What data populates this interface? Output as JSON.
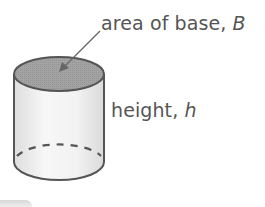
{
  "figure": {
    "type": "cylinder-diagram",
    "labels": {
      "base": {
        "text": "area of base, ",
        "variable": "B"
      },
      "height": {
        "text": "height, ",
        "variable": "h"
      }
    },
    "colors": {
      "outline": "#555555",
      "top_fill": "#9a9a9a",
      "body_fill_light": "#f4f4f4",
      "body_fill_shade": "#dcdcdc",
      "text": "#555555"
    }
  }
}
